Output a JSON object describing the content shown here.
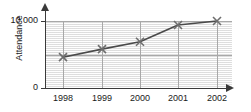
{
  "chart_data": {
    "type": "line",
    "title": "",
    "xlabel": "",
    "ylabel": "Attendance",
    "categories": [
      "1998",
      "1999",
      "2000",
      "2001",
      "2002"
    ],
    "values": [
      4600,
      5800,
      6900,
      9400,
      10000
    ],
    "series": [
      {
        "name": "Attendance",
        "values": [
          4600,
          5800,
          6900,
          9400,
          10000
        ]
      }
    ],
    "ylim": [
      0,
      10000
    ],
    "y_tick_labels": [
      "0",
      "10 000"
    ],
    "y_ticks": [
      0,
      10000
    ],
    "x_tick_labels": [
      "1998",
      "1999",
      "2000",
      "2001",
      "2002"
    ],
    "grid": true,
    "grid_lines": {
      "vertical_at_categories": true,
      "horizontal_at_values": [
        5000,
        10000
      ]
    },
    "legend": "none",
    "marker": "x-cross",
    "line_color": "#4a4a4a",
    "marker_color": "#6e6e6e",
    "grid_color": "#a8a8a8",
    "axis_color": "#3a3a3a",
    "plot_background": "#f2f2f2"
  },
  "axis": {
    "y_label": "Attendance",
    "y_max_label": "10 000",
    "y_zero_label": "0"
  }
}
